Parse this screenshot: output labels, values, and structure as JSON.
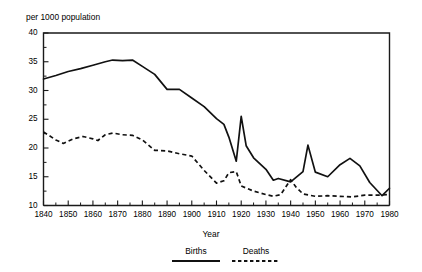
{
  "chart_data": {
    "type": "line",
    "title": "per 1000 population",
    "subtitle": "",
    "xlabel": "Year",
    "ylabel": "",
    "xlim": [
      1840,
      1980
    ],
    "ylim": [
      10,
      40
    ],
    "grid": false,
    "legend_position": "bottom",
    "x_ticks": [
      1840,
      1850,
      1860,
      1870,
      1880,
      1890,
      1900,
      1910,
      1920,
      1930,
      1940,
      1950,
      1960,
      1970,
      1980
    ],
    "x_tick_labels": [
      "1840",
      "1850",
      "1860",
      "1870",
      "1880",
      "1890",
      "1900",
      "1910",
      "1920",
      "1930",
      "1940",
      "1950",
      "1960",
      "1970",
      "1980"
    ],
    "x_minor_interval": 5,
    "y_ticks": [
      10,
      15,
      20,
      25,
      30,
      35,
      40
    ],
    "y_tick_labels": [
      "10",
      "15",
      "20",
      "25",
      "30",
      "35",
      "40"
    ],
    "series": [
      {
        "name": "Births",
        "style": "solid",
        "color": "#111111",
        "points": [
          [
            1840,
            32.0
          ],
          [
            1845,
            32.6
          ],
          [
            1850,
            33.3
          ],
          [
            1855,
            33.8
          ],
          [
            1860,
            34.4
          ],
          [
            1865,
            35.0
          ],
          [
            1868,
            35.3
          ],
          [
            1872,
            35.2
          ],
          [
            1876,
            35.3
          ],
          [
            1880,
            34.2
          ],
          [
            1885,
            32.8
          ],
          [
            1890,
            30.2
          ],
          [
            1895,
            30.2
          ],
          [
            1900,
            28.7
          ],
          [
            1905,
            27.2
          ],
          [
            1910,
            25.1
          ],
          [
            1913,
            24.1
          ],
          [
            1915,
            21.9
          ],
          [
            1918,
            17.7
          ],
          [
            1920,
            25.5
          ],
          [
            1922,
            20.4
          ],
          [
            1925,
            18.3
          ],
          [
            1930,
            16.3
          ],
          [
            1933,
            14.4
          ],
          [
            1935,
            14.7
          ],
          [
            1940,
            14.1
          ],
          [
            1945,
            15.9
          ],
          [
            1947,
            20.5
          ],
          [
            1950,
            15.8
          ],
          [
            1955,
            15.0
          ],
          [
            1960,
            17.1
          ],
          [
            1964,
            18.2
          ],
          [
            1968,
            16.9
          ],
          [
            1972,
            14.0
          ],
          [
            1977,
            11.7
          ],
          [
            1980,
            13.0
          ]
        ]
      },
      {
        "name": "Deaths",
        "style": "dashed",
        "color": "#111111",
        "points": [
          [
            1840,
            22.8
          ],
          [
            1845,
            21.4
          ],
          [
            1848,
            20.8
          ],
          [
            1852,
            21.6
          ],
          [
            1856,
            22.0
          ],
          [
            1860,
            21.6
          ],
          [
            1862,
            21.3
          ],
          [
            1865,
            22.3
          ],
          [
            1868,
            22.6
          ],
          [
            1872,
            22.3
          ],
          [
            1876,
            22.2
          ],
          [
            1880,
            21.4
          ],
          [
            1885,
            19.6
          ],
          [
            1890,
            19.5
          ],
          [
            1895,
            19.0
          ],
          [
            1900,
            18.6
          ],
          [
            1905,
            16.1
          ],
          [
            1910,
            13.9
          ],
          [
            1913,
            14.3
          ],
          [
            1915,
            15.7
          ],
          [
            1918,
            15.9
          ],
          [
            1920,
            13.4
          ],
          [
            1925,
            12.5
          ],
          [
            1930,
            11.9
          ],
          [
            1933,
            11.6
          ],
          [
            1936,
            11.9
          ],
          [
            1940,
            14.5
          ],
          [
            1942,
            13.3
          ],
          [
            1945,
            12.0
          ],
          [
            1950,
            11.6
          ],
          [
            1955,
            11.7
          ],
          [
            1960,
            11.6
          ],
          [
            1965,
            11.5
          ],
          [
            1970,
            11.8
          ],
          [
            1975,
            11.8
          ],
          [
            1980,
            11.9
          ]
        ]
      }
    ],
    "legend": [
      {
        "label": "Births",
        "style": "solid"
      },
      {
        "label": "Deaths",
        "style": "dashed"
      }
    ]
  }
}
